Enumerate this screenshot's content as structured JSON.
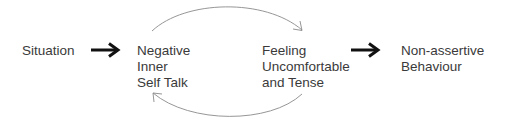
{
  "diagram": {
    "type": "flow-with-feedback-loop",
    "nodes": [
      {
        "id": "situation",
        "lines": [
          "Situation"
        ]
      },
      {
        "id": "negative-inner-self-talk",
        "lines": [
          "Negative",
          "Inner",
          "Self Talk"
        ]
      },
      {
        "id": "feeling-uncomfortable",
        "lines": [
          "Feeling",
          "Uncomfortable",
          "and Tense"
        ]
      },
      {
        "id": "non-assertive-behaviour",
        "lines": [
          "Non-assertive",
          "Behaviour"
        ]
      }
    ],
    "edges": [
      {
        "from": "situation",
        "to": "negative-inner-self-talk",
        "style": "bold-arrow"
      },
      {
        "from": "negative-inner-self-talk",
        "to": "feeling-uncomfortable",
        "style": "thin-curved-arrow-top"
      },
      {
        "from": "feeling-uncomfortable",
        "to": "negative-inner-self-talk",
        "style": "thin-curved-arrow-bottom"
      },
      {
        "from": "feeling-uncomfortable",
        "to": "non-assertive-behaviour",
        "style": "bold-arrow"
      }
    ],
    "colors": {
      "text": "#3a3a3a",
      "bold_arrow": "#111111",
      "curve_arrow": "#8a8a8a",
      "background": "#ffffff"
    }
  }
}
